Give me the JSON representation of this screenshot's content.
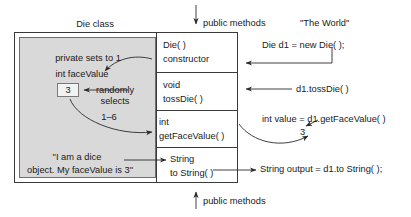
{
  "diagram": {
    "title_die_class": "Die class",
    "title_world": "\"The World\"",
    "top_arrow_label": "public methods",
    "bottom_arrow_label": "public methods"
  },
  "private_section": {
    "comment_sets_to_one": "private sets to 1",
    "field_declaration": "int faceValue",
    "field_value": "3",
    "randomly_selects_line1": "randomly",
    "randomly_selects_line2": "selects",
    "range_label": "1–6",
    "to_string_text_line1": "\"I am a dice",
    "to_string_text_line2": "object. My faceValue is 3\""
  },
  "methods": [
    {
      "name": "method-constructor",
      "line1": "Die( )",
      "line2": "constructor"
    },
    {
      "name": "method-toss-die",
      "line1": "void",
      "line2": "tossDie( )"
    },
    {
      "name": "method-get-face-value",
      "line1": "int",
      "line2": "getFaceValue( )"
    },
    {
      "name": "method-to-string",
      "line1": "String",
      "line2": "to String( )"
    }
  ],
  "world_calls": [
    {
      "name": "call-new-die",
      "text": "Die d1 = new Die( );"
    },
    {
      "name": "call-toss-die",
      "text": "d1.tossDie( )"
    },
    {
      "name": "call-get-face-value",
      "text": "int value = d1.getFaceValue( )"
    },
    {
      "name": "call-get-face-value-result",
      "text": "3"
    },
    {
      "name": "call-to-string",
      "text": "String output = d1.to String( );"
    }
  ],
  "colors": {
    "private_fill": "#d9d9d9",
    "line": "#3a3a3a",
    "text": "#1a1a1a",
    "value_fill": "#f2f2f2"
  }
}
